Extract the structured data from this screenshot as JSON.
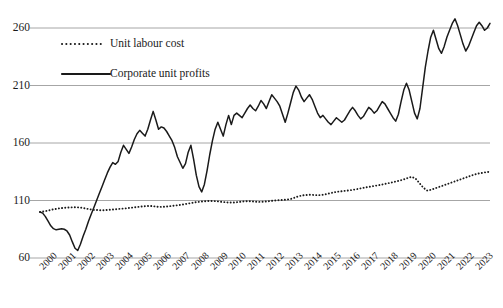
{
  "chart_data": {
    "type": "line",
    "title": "",
    "xlabel": "",
    "ylabel": "",
    "ylim": [
      60,
      275
    ],
    "yticks": [
      60,
      110,
      160,
      210,
      260
    ],
    "grid": true,
    "legend_position": "inside upper-left",
    "x_tick_labels": [
      "2000",
      "2001",
      "2002",
      "2003",
      "2004",
      "2005",
      "2006",
      "2007",
      "2008",
      "2009",
      "2010",
      "2011",
      "2012",
      "2013",
      "2014",
      "2015",
      "2016",
      "2017",
      "2018",
      "2019",
      "2020",
      "2021",
      "2022",
      "2023"
    ],
    "x_start": 2000,
    "x_end": 2023.75,
    "series": [
      {
        "name": "Unit labour cost",
        "style": "dotted",
        "color": "#1a1a1a",
        "values": [
          100.0,
          100.5,
          101.2,
          102.0,
          102.6,
          103.2,
          103.6,
          103.9,
          104.0,
          104.2,
          104.0,
          103.5,
          102.8,
          102.2,
          101.8,
          101.6,
          101.5,
          101.7,
          102.0,
          102.3,
          102.6,
          102.9,
          103.2,
          103.6,
          104.0,
          104.4,
          104.8,
          105.1,
          105.3,
          105.0,
          104.6,
          104.4,
          104.6,
          105.0,
          105.4,
          105.8,
          106.2,
          106.8,
          107.4,
          108.0,
          108.6,
          109.0,
          109.3,
          109.5,
          109.6,
          109.4,
          109.0,
          108.6,
          108.3,
          108.2,
          108.4,
          108.8,
          109.2,
          109.4,
          109.3,
          109.0,
          108.8,
          108.9,
          109.2,
          109.6,
          110.0,
          110.3,
          110.5,
          110.8,
          111.2,
          112.4,
          113.6,
          114.4,
          114.8,
          115.0,
          114.8,
          114.6,
          114.8,
          115.4,
          116.2,
          117.0,
          117.6,
          118.0,
          118.4,
          118.8,
          119.3,
          119.9,
          120.6,
          121.2,
          121.8,
          122.4,
          123.0,
          123.6,
          124.3,
          125.0,
          125.8,
          126.6,
          127.4,
          128.4,
          129.6,
          130.6,
          129.0,
          125.0,
          121.0,
          118.6,
          119.4,
          120.6,
          121.8,
          123.0,
          124.2,
          125.4,
          126.6,
          127.8,
          129.0,
          130.2,
          131.4,
          132.6,
          133.4,
          134.0,
          134.6,
          135.0
        ]
      },
      {
        "name": "Corporate unit profits",
        "style": "solid",
        "color": "#1a1a1a",
        "values": [
          100.0,
          99.0,
          96.0,
          92.0,
          88.0,
          85.5,
          84.5,
          85.0,
          85.5,
          85.0,
          83.5,
          80.0,
          74.0,
          68.5,
          66.5,
          72.0,
          79.0,
          85.0,
          92.0,
          98.0,
          104.0,
          110.0,
          116.0,
          122.0,
          128.0,
          134.0,
          139.0,
          143.0,
          141.5,
          144.0,
          152.0,
          158.0,
          154.5,
          151.0,
          156.5,
          163.0,
          168.0,
          171.0,
          168.5,
          166.0,
          172.0,
          180.0,
          187.5,
          180.0,
          172.0,
          174.0,
          173.0,
          170.0,
          166.0,
          162.0,
          156.0,
          148.0,
          143.0,
          138.0,
          142.0,
          152.0,
          158.0,
          146.0,
          132.0,
          122.0,
          117.5,
          124.0,
          136.0,
          150.0,
          162.0,
          172.0,
          178.0,
          172.0,
          166.0,
          176.0,
          184.0,
          176.0,
          184.0,
          186.0,
          184.0,
          182.0,
          186.0,
          190.0,
          193.0,
          190.0,
          188.0,
          192.0,
          197.0,
          194.0,
          190.0,
          196.0,
          202.0,
          199.0,
          196.0,
          192.0,
          185.0,
          178.0,
          186.0,
          195.0,
          204.0,
          209.5,
          206.0,
          200.0,
          196.0,
          199.0,
          202.0,
          198.0,
          192.0,
          186.0,
          182.0,
          184.0,
          181.0,
          178.0,
          176.0,
          179.0,
          182.0,
          180.0,
          178.0,
          180.0,
          184.0,
          188.0,
          191.0,
          188.0,
          184.0,
          181.0,
          183.0,
          187.0,
          191.0,
          189.0,
          186.0,
          188.0,
          192.0,
          196.0,
          194.0,
          190.0,
          186.0,
          182.0,
          179.0,
          185.0,
          196.0,
          206.0,
          212.0,
          206.0,
          196.0,
          186.0,
          181.0,
          190.0,
          208.0,
          226.0,
          240.0,
          252.0,
          258.0,
          250.0,
          242.0,
          238.0,
          244.0,
          252.0,
          258.0,
          264.0,
          268.0,
          262.0,
          254.0,
          246.0,
          240.0,
          244.0,
          250.0,
          256.0,
          262.0,
          265.0,
          262.0,
          258.0,
          260.0,
          264.0
        ]
      }
    ]
  },
  "legend": {
    "items": [
      {
        "label": "Unit labour cost",
        "style": "dotted"
      },
      {
        "label": "Corporate unit profits",
        "style": "solid"
      }
    ]
  },
  "axis": {
    "y_labels": [
      "260",
      "210",
      "160",
      "110",
      "60"
    ],
    "x_labels": [
      "2000",
      "2001",
      "2002",
      "2003",
      "2004",
      "2005",
      "2006",
      "2007",
      "2008",
      "2009",
      "2010",
      "2011",
      "2012",
      "2013",
      "2014",
      "2015",
      "2016",
      "2017",
      "2018",
      "2019",
      "2020",
      "2021",
      "2022",
      "2023"
    ]
  },
  "colors": {
    "line": "#1a1a1a",
    "grid": "#a6a6a6",
    "background": "#ffffff"
  }
}
